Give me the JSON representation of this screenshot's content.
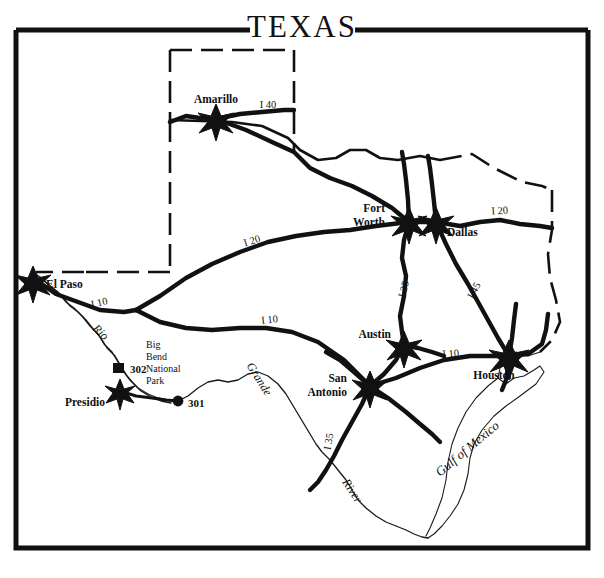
{
  "map": {
    "title": "TEXAS",
    "width": 604,
    "height": 578,
    "frame_color": "#111111",
    "background_color": "#ffffff",
    "ink_color": "#111111"
  },
  "cities": [
    {
      "name": "Amarillo",
      "marker": "star",
      "label_lines": [
        "Amarillo"
      ],
      "x": 216,
      "y": 119,
      "label_x": 216,
      "label_y": 103,
      "anchor": "middle"
    },
    {
      "name": "Fort Worth",
      "marker": "star",
      "label_lines": [
        "Fort",
        "Worth"
      ],
      "x": 409,
      "y": 222,
      "label_x": 385,
      "label_y": 212,
      "anchor": "end"
    },
    {
      "name": "Dallas",
      "marker": "star",
      "label_lines": [
        "Dallas"
      ],
      "x": 436,
      "y": 222,
      "label_x": 447,
      "label_y": 236,
      "anchor": "start"
    },
    {
      "name": "El Paso",
      "marker": "star",
      "label_lines": [
        "El  Paso"
      ],
      "x": 33,
      "y": 281,
      "label_x": 46,
      "label_y": 288,
      "anchor": "start"
    },
    {
      "name": "Austin",
      "marker": "star",
      "label_lines": [
        "Austin"
      ],
      "x": 404,
      "y": 345,
      "label_x": 391,
      "label_y": 336,
      "anchor": "end"
    },
    {
      "name": "Houston",
      "marker": "star",
      "label_lines": [
        "Houston"
      ],
      "x": 509,
      "y": 356,
      "label_x": 494,
      "label_y": 376,
      "anchor": "middle"
    },
    {
      "name": "San Antonio",
      "marker": "star",
      "label_lines": [
        "San",
        "Antonio"
      ],
      "x": 370,
      "y": 386,
      "label_x": 345,
      "label_y": 383,
      "anchor": "end"
    },
    {
      "name": "Presidio",
      "marker": "star",
      "label_lines": [
        "Presidio"
      ],
      "x": 120,
      "y": 391,
      "label_x": 110,
      "label_y": 406,
      "anchor": "end"
    }
  ],
  "highways": [
    {
      "label": "I 40",
      "x": 268,
      "y": 108,
      "rotate": 0
    },
    {
      "label": "I 20",
      "x": 500,
      "y": 214,
      "rotate": -4
    },
    {
      "label": "I 20",
      "x": 253,
      "y": 244,
      "rotate": -18
    },
    {
      "label": "I 10",
      "x": 100,
      "y": 306,
      "rotate": -12
    },
    {
      "label": "I 10",
      "x": 270,
      "y": 323,
      "rotate": -6
    },
    {
      "label": "I 10",
      "x": 451,
      "y": 357,
      "rotate": -4
    },
    {
      "label": "I 35",
      "x": 407,
      "y": 290,
      "rotate": -76
    },
    {
      "label": "I 45",
      "x": 477,
      "y": 292,
      "rotate": -62
    },
    {
      "label": "I 35",
      "x": 332,
      "y": 442,
      "rotate": -80
    }
  ],
  "sites": [
    {
      "id": "302",
      "label": "302",
      "marker": "square",
      "marker_x": 119,
      "marker_y": 369,
      "label_x": 128,
      "label_y": 373
    },
    {
      "id": "301",
      "label": "301",
      "marker": "circle",
      "marker_x": 178,
      "marker_y": 401,
      "label_x": 188,
      "label_y": 406
    }
  ],
  "park": {
    "name": "Big Bend National Park",
    "lines": [
      "Big",
      "Bend",
      "National",
      "Park"
    ],
    "x": 158,
    "y": 352
  },
  "water_features": [
    {
      "name": "Gulf of Mexico",
      "label": "Gulf of Mexico",
      "x": 470,
      "y": 452,
      "rotate": -40
    }
  ],
  "river_labels": [
    {
      "name": "Rio",
      "label": "Rio",
      "x": 98,
      "y": 335,
      "rotate": 44
    },
    {
      "name": "Grande",
      "label": "Grande",
      "x": 256,
      "y": 381,
      "rotate": 58
    },
    {
      "name": "River",
      "label": "River",
      "x": 349,
      "y": 493,
      "rotate": 57
    }
  ]
}
